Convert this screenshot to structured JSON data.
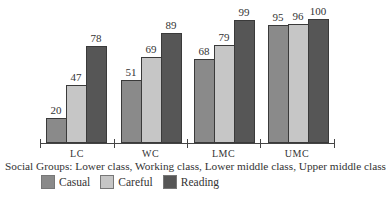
{
  "chart_data": {
    "type": "bar",
    "title": "",
    "xlabel": "Social Groups: Lower class, Working class, Lower middle class, Upper middle class",
    "ylabel": "",
    "categories": [
      "LC",
      "WC",
      "LMC",
      "UMC"
    ],
    "series": [
      {
        "name": "Casual",
        "color": "#8a8a8a",
        "values": [
          20,
          51,
          68,
          95
        ]
      },
      {
        "name": "Careful",
        "color": "#c6c6c6",
        "values": [
          47,
          69,
          79,
          96
        ]
      },
      {
        "name": "Reading",
        "color": "#565656",
        "values": [
          78,
          89,
          99,
          100
        ]
      }
    ],
    "ylim": [
      0,
      100
    ],
    "grid": false,
    "legend_position": "bottom",
    "data_labels": true
  },
  "legend": {
    "items": [
      {
        "label": "Casual",
        "color": "#8a8a8a"
      },
      {
        "label": "Careful",
        "color": "#c6c6c6"
      },
      {
        "label": "Reading",
        "color": "#565656"
      }
    ]
  }
}
